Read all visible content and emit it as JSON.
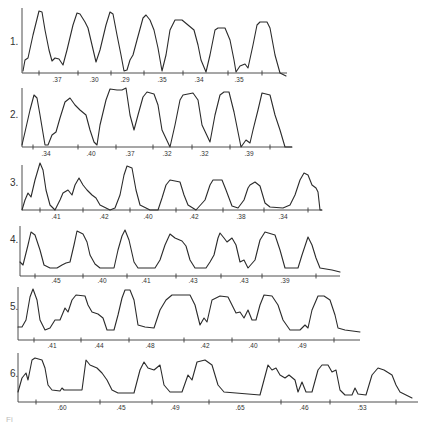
{
  "figure": {
    "caption_fragment": "Fi",
    "rows": [
      {
        "label": "1.",
        "label_xy": [
          10,
          45
        ],
        "axis": {
          "x0": 22,
          "x1": 287,
          "y": 73,
          "vline_top": 8
        },
        "ticks": [
          39,
          78,
          111,
          144,
          183,
          228,
          262
        ],
        "values": [
          ".37",
          ".30",
          ".29",
          ".35",
          ".34",
          ".35"
        ],
        "value_xs": [
          57,
          94,
          125,
          162,
          199,
          239
        ],
        "value_y": 82,
        "path": "M23,71 L25,60 L28,58 L33,35 L39,11 L42,12 L45,30 L49,50 L52,61 L55,58 L59,59 L63,65 L67,50 L73,25 L77,13 L80,14 L85,22 L88,28 L92,45 L96,62 L100,50 L106,25 L110,12 L113,14 L117,35 L121,55 L124,71 L127,70 L130,60 L133,55 L137,40 L143,18 L146,15 L150,20 L154,30 L158,48 L162,71 L166,55 L170,30 L175,20 L182,20 L188,25 L194,30 L198,45 L201,60 L206,72 L210,55 L215,30 L218,28 L225,28 L230,40 L234,60 L236,72 L240,66 L245,64 L248,68 L253,45 L257,25 L260,22 L267,22 L270,28 L275,55 L280,73 L286,76"
      },
      {
        "label": "2.",
        "label_xy": [
          10,
          118
        ],
        "axis": {
          "x0": 22,
          "x1": 292,
          "y": 147,
          "vline_top": 88
        },
        "ticks": [
          33,
          78,
          116,
          153,
          192,
          230,
          270
        ],
        "values": [
          ".34",
          ".40",
          ".37",
          ".32",
          ".32",
          ".39"
        ],
        "value_xs": [
          46,
          91,
          130,
          167,
          204,
          249
        ],
        "value_y": 156,
        "path": "M22,145 L25,132 L30,110 L34,95 L37,98 L40,115 L45,145 L48,145 L52,135 L56,132 L60,118 L65,102 L70,98 L75,105 L80,110 L86,115 L90,130 L94,142 L97,145 L100,125 L106,100 L110,89 L117,90 L122,90 L126,88 L130,115 L134,130 L138,115 L143,97 L147,92 L154,94 L158,105 L162,130 L170,147 L175,125 L180,100 L183,95 L193,93 L198,100 L202,125 L210,142 L215,115 L220,95 L224,92 L229,92 L234,112 L241,147 L246,140 L250,143 L253,130 L258,110 L262,93 L270,95 L275,115 L280,130 L285,147 L292,147"
      },
      {
        "label": "3.",
        "label_xy": [
          10,
          186
        ],
        "axis": {
          "x0": 22,
          "x1": 322,
          "y": 210,
          "vline_top": 165
        },
        "ticks": [
          40,
          83,
          130,
          176,
          223,
          264,
          308
        ],
        "values": [
          ".41",
          ".42",
          ".40",
          ".42",
          ".38",
          ".34"
        ],
        "value_xs": [
          56,
          104,
          148,
          194,
          241,
          283
        ],
        "value_y": 219,
        "path": "M22,210 L25,200 L28,193 L31,197 L35,180 L40,163 L43,170 L46,190 L50,205 L55,210 L60,200 L63,193 L68,190 L72,195 L75,185 L79,178 L83,185 L87,190 L92,195 L96,198 L100,205 L110,210 L115,208 L120,195 L124,175 L127,166 L132,168 L136,190 L140,205 L150,210 L158,210 L162,198 L166,185 L170,180 L180,182 L184,195 L188,205 L196,210 L205,200 L210,185 L213,180 L222,180 L226,190 L232,206 L238,208 L244,200 L248,188 L250,185 L255,182 L260,186 L265,203 L270,207 L283,208 L290,205 L295,195 L300,180 L304,173 L308,175 L312,185 L316,188 L318,192 L320,210 L322,210"
      },
      {
        "label": "4.",
        "label_xy": [
          10,
          243
        ],
        "axis": {
          "x0": 20,
          "x1": 340,
          "y": 276,
          "vline_top": 226
        },
        "ticks": [
          35,
          83,
          127,
          176,
          221,
          262,
          316
        ],
        "values": [
          ".45",
          ".40",
          ".41",
          ".43",
          ".43",
          ".39"
        ],
        "value_xs": [
          56,
          102,
          146,
          193,
          244,
          285
        ],
        "value_y": 283,
        "path": "M20,262 L23,265 L28,245 L31,232 L35,235 L40,250 L44,265 L50,268 L57,268 L62,265 L66,263 L70,262 L74,245 L77,231 L83,234 L87,242 L90,255 L95,264 L100,268 L114,268 L118,250 L122,236 L125,230 L129,240 L134,262 L138,268 L155,268 L160,260 L165,245 L170,234 L175,238 L182,241 L186,246 L190,260 L195,268 L206,268 L210,262 L214,255 L218,238 L220,233 L224,238 L227,242 L232,238 L236,245 L240,262 L244,260 L248,268 L255,260 L260,240 L265,232 L275,235 L280,250 L285,268 L298,268 L302,255 L308,237 L312,245 L316,258 L320,268 L332,270 L340,272"
      },
      {
        "label": "5.",
        "label_xy": [
          10,
          310
        ],
        "axis": {
          "x0": 18,
          "x1": 360,
          "y": 340,
          "vline_top": 287
        },
        "ticks": [
          34,
          81,
          129,
          184,
          232,
          279,
          334
        ],
        "values": [
          ".41",
          ".44",
          ".48",
          ".42",
          ".40",
          ".49"
        ],
        "value_xs": [
          52,
          99,
          150,
          205,
          253,
          302
        ],
        "value_y": 348,
        "path": "M18,327 L22,327 L26,320 L30,297 L33,289 L37,300 L40,320 L45,330 L50,328 L55,320 L60,320 L65,308 L68,312 L72,300 L76,295 L85,296 L88,305 L92,312 L98,314 L103,318 L107,330 L114,330 L118,315 L122,298 L125,290 L130,290 L134,300 L138,325 L145,327 L154,328 L160,310 L166,300 L172,295 L190,295 L195,305 L200,325 L204,318 L207,322 L212,300 L220,296 L228,297 L232,305 L236,313 L240,312 L244,318 L248,310 L252,320 L256,320 L260,305 L264,295 L272,296 L278,305 L283,320 L290,330 L300,330 L305,325 L308,328 L312,310 L318,296 L324,296 L330,300 L335,315 L338,328 L345,330 L360,332"
      },
      {
        "label": "6.",
        "label_xy": [
          10,
          377
        ],
        "axis": {
          "x0": 18,
          "x1": 418,
          "y": 402,
          "vline_top": 353
        },
        "ticks": [
          36,
          100,
          152,
          209,
          281,
          330,
          396
        ],
        "values": [
          ".60",
          ".45",
          ".49",
          ".65",
          ".46",
          ".53"
        ],
        "value_xs": [
          62,
          121,
          175,
          240,
          304,
          362
        ],
        "value_y": 410,
        "path": "M18,392 L22,378 L26,373 L28,380 L32,360 L35,358 L42,360 L45,368 L48,385 L52,390 L60,391 L62,388 L64,390 L82,390 L86,360 L90,365 L97,368 L102,373 L107,380 L112,390 L118,393 L134,393 L140,370 L144,362 L148,368 L154,370 L160,365 L164,385 L170,392 L182,392 L188,375 L192,380 L197,362 L205,360 L212,365 L218,385 L224,392 L260,395 L268,365 L272,370 L276,368 L280,375 L285,378 L289,375 L295,380 L298,392 L302,382 L306,392 L312,392 L318,370 L322,365 L328,365 L332,372 L336,370 L340,390 L345,395 L352,395 L355,388 L358,394 L366,395 L372,375 L378,368 L384,370 L392,375 L396,385 L400,392 L406,395 L412,398"
      }
    ]
  }
}
